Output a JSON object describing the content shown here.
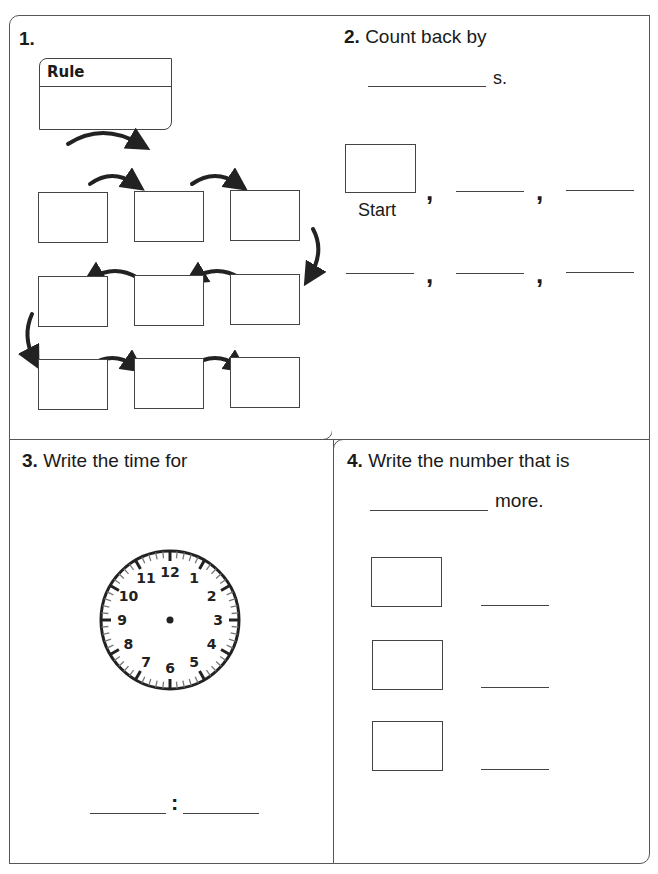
{
  "problem1": {
    "number": "1.",
    "rule_label": "Rule",
    "grid": {
      "rows": 3,
      "cols": 3
    }
  },
  "problem2": {
    "number": "2.",
    "prompt": "Count back by",
    "suffix": "s.",
    "start_label": "Start",
    "comma": ","
  },
  "problem3": {
    "number": "3.",
    "prompt": "Write the time for",
    "clock_numbers": [
      "12",
      "1",
      "2",
      "3",
      "4",
      "5",
      "6",
      "7",
      "8",
      "9",
      "10",
      "11"
    ],
    "colon": ":"
  },
  "problem4": {
    "number": "4.",
    "prompt": "Write the number that is",
    "suffix": "more."
  }
}
